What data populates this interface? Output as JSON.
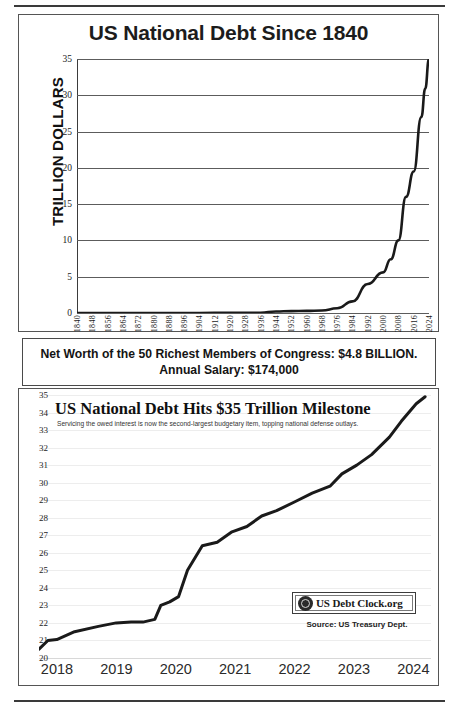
{
  "chart_data": [
    {
      "type": "line",
      "id": "us-national-debt-since-1840",
      "title": "US National Debt Since 1840",
      "xlabel": "",
      "ylabel": "TRILLION DOLLARS",
      "ylim": [
        0,
        35
      ],
      "yticks": [
        0,
        5,
        10,
        15,
        20,
        25,
        30,
        35
      ],
      "xlim": [
        1840,
        2024
      ],
      "xticks": [
        1840,
        1848,
        1856,
        1864,
        1872,
        1880,
        1888,
        1896,
        1904,
        1912,
        1920,
        1928,
        1936,
        1944,
        1952,
        1960,
        1968,
        1976,
        1984,
        1992,
        2000,
        2008,
        2016,
        2024
      ],
      "grid": true,
      "legend": "none",
      "x": [
        1840,
        1856,
        1872,
        1888,
        1904,
        1920,
        1936,
        1944,
        1952,
        1960,
        1968,
        1976,
        1984,
        1992,
        2000,
        2004,
        2008,
        2012,
        2016,
        2020,
        2022,
        2024
      ],
      "values": [
        0,
        0,
        0,
        0,
        0,
        0.03,
        0.04,
        0.2,
        0.26,
        0.29,
        0.35,
        0.65,
        1.6,
        4.0,
        5.6,
        7.4,
        10.0,
        16.0,
        19.5,
        27.0,
        30.9,
        35.0
      ]
    },
    {
      "type": "line",
      "id": "us-national-debt-hits-35-trillion",
      "title": "US National Debt Hits $35 Trillion Milestone",
      "subtitle": "Servicing the owed interest is now the second-largest budgetary item, topping national defense outlays.",
      "xlabel": "",
      "ylabel": "",
      "ylim": [
        20,
        35
      ],
      "yticks": [
        20,
        21,
        22,
        23,
        24,
        25,
        26,
        27,
        28,
        29,
        30,
        31,
        32,
        33,
        34,
        35
      ],
      "xlim": [
        2018,
        2024.6
      ],
      "xticks": [
        2018,
        2019,
        2020,
        2021,
        2022,
        2023,
        2024
      ],
      "grid": true,
      "legend": "none",
      "source_note": "Source: US Treasury Dept.",
      "badge_label": "US Debt Clock.org",
      "badge_icon": "debt-clock-emblem-icon",
      "x": [
        2018.0,
        2018.15,
        2018.3,
        2018.6,
        2019.0,
        2019.3,
        2019.55,
        2019.75,
        2019.95,
        2020.05,
        2020.2,
        2020.35,
        2020.5,
        2020.75,
        2021.0,
        2021.25,
        2021.5,
        2021.75,
        2022.0,
        2022.3,
        2022.6,
        2022.9,
        2023.1,
        2023.35,
        2023.6,
        2023.9,
        2024.1,
        2024.35,
        2024.5
      ],
      "values": [
        20.5,
        21.0,
        21.05,
        21.5,
        21.8,
        22.0,
        22.05,
        22.05,
        22.2,
        23.0,
        23.2,
        23.5,
        25.0,
        26.4,
        26.6,
        27.2,
        27.5,
        28.1,
        28.4,
        28.9,
        29.4,
        29.8,
        30.5,
        31.0,
        31.6,
        32.6,
        33.5,
        34.5,
        34.9
      ]
    }
  ],
  "top_panel": {
    "title": "US National Debt Since 1840",
    "ylabel": "TRILLION DOLLARS"
  },
  "callout": {
    "line1": "Net Worth of the 50 Richest Members of Congress: $4.8 BILLION.",
    "line2": "Annual Salary: $174,000"
  },
  "bottom_panel": {
    "title": "US National Debt Hits $35 Trillion Milestone",
    "subtitle": "Servicing the owed interest is now the second-largest budgetary item, topping national defense outlays.",
    "badge_label": "US Debt Clock.org",
    "source": "Source: US Treasury Dept."
  },
  "colors": {
    "line": "#1a1a1a",
    "grid_top": "#5c5c5c",
    "grid_bottom": "#ededed",
    "border": "#555555",
    "text": "#1a1a1a"
  }
}
